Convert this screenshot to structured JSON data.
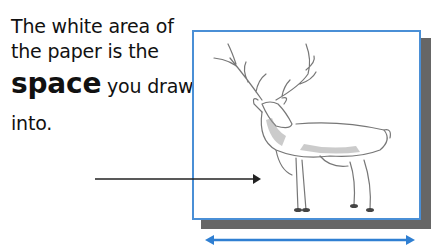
{
  "caption": {
    "line1": "The white area of",
    "line2": "the paper is the",
    "emphasis": "space",
    "line3_rest": " you draw",
    "line4": "into."
  },
  "illustration": {
    "subject": "deer-sketch",
    "paper_border_color": "#4a8fd6",
    "shadow_color": "#666666",
    "width_arrow_color": "#2f7fd2",
    "pointer_arrow_color": "#222222"
  }
}
